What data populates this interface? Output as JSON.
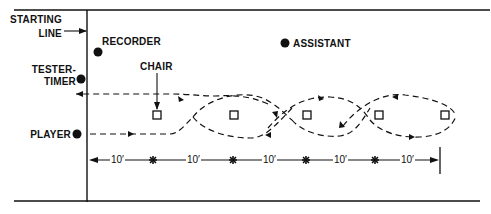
{
  "diagram": {
    "type": "test-course-layout",
    "labels": {
      "starting_line_1": "STARTING",
      "starting_line_2": "LINE",
      "recorder": "RECORDER",
      "assistant": "ASSISTANT",
      "tester_timer_1": "TESTER-",
      "tester_timer_2": "TIMER",
      "chair": "CHAIR",
      "player": "PLAYER"
    },
    "distances": [
      "10′",
      "10′",
      "10′",
      "10′",
      "10′"
    ],
    "chair_count": 5,
    "marker_count": 4,
    "colors": {
      "ink": "#111111",
      "background": "#ffffff"
    }
  }
}
